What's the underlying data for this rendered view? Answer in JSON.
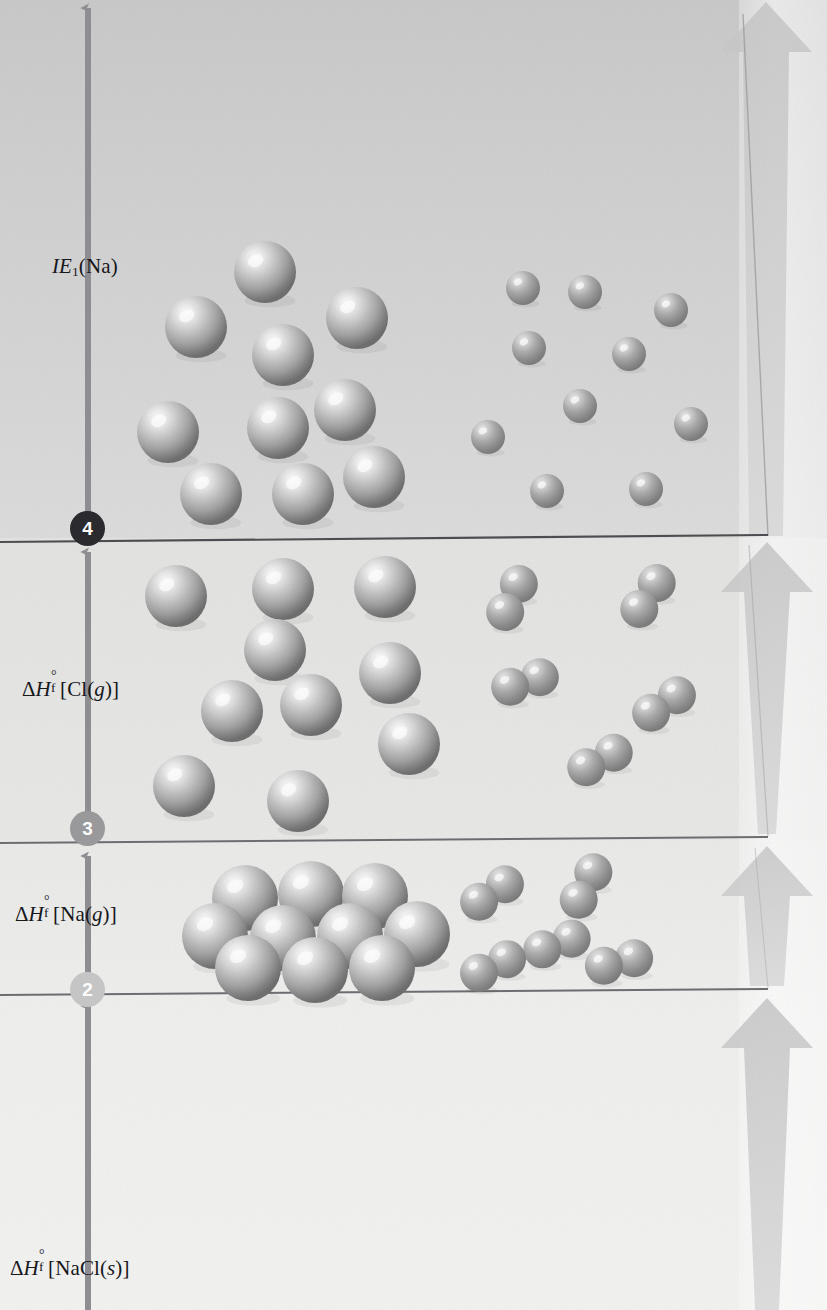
{
  "figure": {
    "type": "energy-level-diagram",
    "width": 827,
    "height": 1310,
    "background_color": "#e9e9e8"
  },
  "axis": {
    "name": "enthalpy-axis",
    "direction": "up",
    "x": 88,
    "color": "#8f8f93"
  },
  "levels": [
    {
      "id": "level-1",
      "label": "",
      "y": 992,
      "line_color": "#6a6a6e"
    },
    {
      "id": "level-2",
      "label": "",
      "y": 840,
      "line_color": "#6a6a6e"
    },
    {
      "id": "level-3",
      "label": "",
      "y": 538,
      "line_color": "#4f4f53"
    }
  ],
  "steps": [
    {
      "number": "2",
      "y": 990,
      "circle_color": "#c7c7c7",
      "text_color": "#ffffff"
    },
    {
      "number": "3",
      "y": 829,
      "circle_color": "#9a9a9c",
      "text_color": "#ffffff"
    },
    {
      "number": "4",
      "y": 529,
      "circle_color": "#2a2a2e",
      "text_color": "#ffffff"
    }
  ],
  "energy_labels": [
    {
      "id": "ie1-na",
      "text": "IE1(Na)",
      "parts": {
        "italic": "IE",
        "sub": "1",
        "rest": "(Na)"
      },
      "x": 52,
      "y": 254,
      "meaning": "first ionization energy of sodium"
    },
    {
      "id": "dhf-cl-g",
      "text": "ΔH°f[Cl(g)]",
      "parts": {
        "delta": "Δ",
        "italic": "H",
        "sup": "°",
        "sub": "f",
        "rest": "[Cl(",
        "italic2": "g",
        "tail": ")]"
      },
      "x": 22,
      "y": 675,
      "meaning": "standard enthalpy of formation of gaseous chlorine atoms"
    },
    {
      "id": "dhf-na-g",
      "text": "ΔH°f[Na(g)]",
      "parts": {
        "delta": "Δ",
        "italic": "H",
        "sup": "°",
        "sub": "f",
        "rest": "[Na(",
        "italic2": "g",
        "tail": ")]"
      },
      "x": 15,
      "y": 900,
      "meaning": "standard enthalpy of formation of gaseous sodium atoms"
    },
    {
      "id": "dhf-nacl-s",
      "text": "ΔH°f[NaCl(s)]",
      "parts": {
        "delta": "Δ",
        "italic": "H",
        "sup": "°",
        "sub": "f",
        "rest": "[NaCl(",
        "italic2": "s",
        "tail": ")]"
      },
      "x": 10,
      "y": 1254,
      "meaning": "standard enthalpy of formation of solid sodium chloride"
    }
  ],
  "right_arrows": [
    {
      "id": "right-arrow-top",
      "tip_y": 0,
      "base_y": 536,
      "color": "#cfcfcf"
    },
    {
      "id": "right-arrow-upper",
      "tip_y": 540,
      "base_y": 836,
      "color": "#d2d2d2"
    },
    {
      "id": "right-arrow-mid",
      "tip_y": 844,
      "base_y": 988,
      "color": "#c8c8c8"
    },
    {
      "id": "right-arrow-lower",
      "tip_y": 996,
      "base_y": 1310,
      "color": "#cdcdcd"
    }
  ],
  "particles": {
    "na_atom": {
      "name": "sodium-atom-sphere",
      "radius": 31,
      "fill": "#a8a8a8",
      "highlight": "#f0f0f0"
    },
    "cl_atom": {
      "name": "chlorine-atom-sphere",
      "radius": 17,
      "fill": "#9d9d9d",
      "highlight": "#e2e2e2"
    },
    "cl2_molecule": {
      "name": "chlorine-molecule",
      "atom_radius": 19,
      "fill": "#9d9d9d"
    }
  },
  "tiers": [
    {
      "id": "tier-top",
      "name": "ions-gas-tier",
      "y_range": [
        0,
        538
      ],
      "left_species": "Na+ gaseous ions",
      "right_species": "Cl gaseous atoms",
      "na_positions": [
        [
          265,
          272
        ],
        [
          196,
          327
        ],
        [
          357,
          318
        ],
        [
          283,
          355
        ],
        [
          168,
          432
        ],
        [
          278,
          428
        ],
        [
          345,
          410
        ],
        [
          211,
          494
        ],
        [
          303,
          494
        ],
        [
          374,
          477
        ]
      ],
      "cl_positions": [
        [
          523,
          288
        ],
        [
          585,
          292
        ],
        [
          671,
          310
        ],
        [
          529,
          348
        ],
        [
          629,
          354
        ],
        [
          580,
          406
        ],
        [
          488,
          437
        ],
        [
          691,
          424
        ],
        [
          547,
          491
        ],
        [
          646,
          489
        ]
      ]
    },
    {
      "id": "tier-3",
      "name": "na-gas-cl-gas-tier",
      "y_range": [
        538,
        840
      ],
      "left_species": "Na gaseous atoms",
      "right_species": "Cl2 gaseous molecules",
      "na_positions": [
        [
          176,
          596
        ],
        [
          283,
          589
        ],
        [
          385,
          587
        ],
        [
          275,
          650
        ],
        [
          232,
          711
        ],
        [
          311,
          705
        ],
        [
          390,
          673
        ],
        [
          409,
          744
        ],
        [
          184,
          786
        ],
        [
          298,
          801
        ]
      ],
      "cl2_positions": [
        [
          512,
          598,
          -64
        ],
        [
          525,
          682,
          -18
        ],
        [
          648,
          596,
          -56
        ],
        [
          664,
          704,
          -34
        ],
        [
          600,
          760,
          -28
        ]
      ]
    },
    {
      "id": "tier-2",
      "name": "na-solid-cl2-gas-tier",
      "y_range": [
        840,
        992
      ],
      "left_species": "Na solid lattice",
      "right_species": "Cl2 gaseous molecules",
      "na_cluster": [
        [
          245,
          898
        ],
        [
          311,
          894
        ],
        [
          375,
          896
        ],
        [
          215,
          936
        ],
        [
          283,
          938
        ],
        [
          350,
          936
        ],
        [
          417,
          934
        ],
        [
          248,
          968
        ],
        [
          315,
          970
        ],
        [
          382,
          968
        ]
      ],
      "cl2_positions": [
        [
          492,
          893,
          -34
        ],
        [
          586,
          886,
          -62
        ],
        [
          557,
          944,
          -20
        ],
        [
          493,
          966,
          -26
        ],
        [
          619,
          962,
          -14
        ]
      ]
    },
    {
      "id": "tier-1",
      "name": "nacl-solid-tier",
      "y_range": [
        992,
        1310
      ],
      "left_species": "",
      "right_species": ""
    }
  ]
}
